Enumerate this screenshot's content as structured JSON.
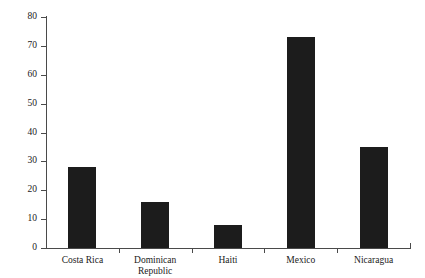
{
  "chart_data": {
    "type": "bar",
    "title": "",
    "subtitle": "",
    "xlabel": "",
    "ylabel": "Percent",
    "categories": [
      "Costa Rica",
      "Dominican Republic",
      "Haiti",
      "Mexico",
      "Nicaragua"
    ],
    "values": [
      28,
      16,
      8,
      73,
      35
    ],
    "ylim": [
      0,
      80
    ],
    "ytick_labels": [
      "0",
      "10",
      "20",
      "30",
      "40",
      "50",
      "60",
      "70",
      "80"
    ],
    "ytick_values": [
      0,
      10,
      20,
      30,
      40,
      50,
      60,
      70,
      80
    ],
    "grid": false,
    "legend": null,
    "bar_color": "#1c1c1c",
    "axis_color": "#4a4a4a",
    "background_color": "#ffffff"
  },
  "axis": {
    "y_title": "Percent"
  },
  "categories_display": [
    "Costa Rica",
    "Dominican\nRepublic",
    "Haiti",
    "Mexico",
    "Nicaragua"
  ]
}
